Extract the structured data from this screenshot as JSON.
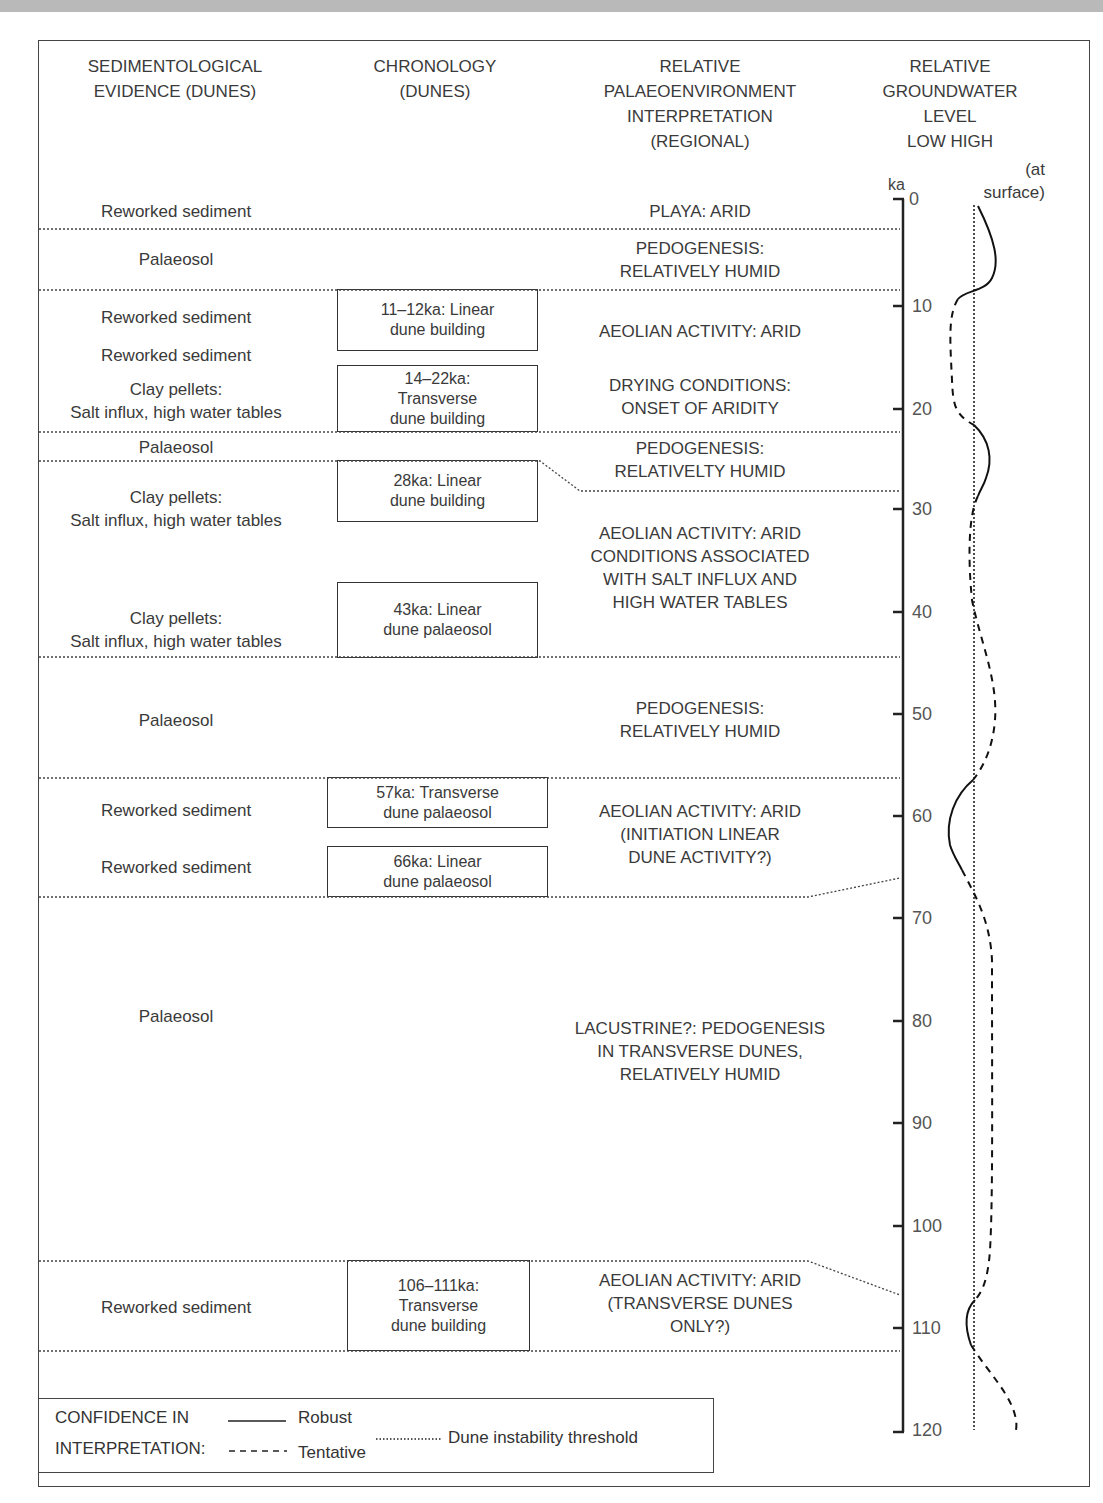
{
  "headers": {
    "sedimentology": "SEDIMENTOLOGICAL\nEVIDENCE (DUNES)",
    "chronology": "CHRONOLOGY\n(DUNES)",
    "palaeoenvironment": "RELATIVE\nPALAEOENVIRONMENT\nINTERPRETATION\n(REGIONAL)",
    "groundwater": "RELATIVE\nGROUNDWATER\nLEVEL\nLOW HIGH",
    "at_surface": "(at\nsurface)",
    "axis_unit": "ka"
  },
  "sedimentology": [
    {
      "text": "Reworked sediment",
      "y": 200
    },
    {
      "text": "Palaeosol",
      "y": 248
    },
    {
      "text": "Reworked sediment",
      "y": 306
    },
    {
      "text": "Reworked sediment",
      "y": 344
    },
    {
      "text": "Clay pellets:\nSalt influx, high water tables",
      "y": 378
    },
    {
      "text": "Palaeosol",
      "y": 436
    },
    {
      "text": "Clay pellets:\nSalt influx, high water tables",
      "y": 486
    },
    {
      "text": "Clay pellets:\nSalt influx, high water tables",
      "y": 607
    },
    {
      "text": "Palaeosol",
      "y": 709
    },
    {
      "text": "Reworked sediment",
      "y": 799
    },
    {
      "text": "Reworked sediment",
      "y": 856
    },
    {
      "text": "Palaeosol",
      "y": 1005
    },
    {
      "text": "Reworked sediment",
      "y": 1296
    }
  ],
  "chronology": [
    {
      "text": "11–12ka: Linear\ndune building",
      "x": 337,
      "y": 289,
      "w": 201,
      "h": 62
    },
    {
      "text": "14–22ka:\nTransverse\ndune building",
      "x": 337,
      "y": 365,
      "w": 201,
      "h": 67
    },
    {
      "text": "28ka: Linear\ndune building",
      "x": 337,
      "y": 460,
      "w": 201,
      "h": 62
    },
    {
      "text": "43ka: Linear\ndune palaeosol",
      "x": 337,
      "y": 582,
      "w": 201,
      "h": 76
    },
    {
      "text": "57ka: Transverse\ndune palaeosol",
      "x": 327,
      "y": 777,
      "w": 221,
      "h": 51
    },
    {
      "text": "66ka: Linear\ndune palaeosol",
      "x": 327,
      "y": 846,
      "w": 221,
      "h": 51
    },
    {
      "text": "106–111ka:\nTransverse\ndune building",
      "x": 347,
      "y": 1260,
      "w": 183,
      "h": 91
    }
  ],
  "palaeoenvironment": [
    {
      "text": "PLAYA: ARID",
      "y": 200
    },
    {
      "text": "PEDOGENESIS:\nRELATIVELY HUMID",
      "y": 237
    },
    {
      "text": "AEOLIAN ACTIVITY: ARID",
      "y": 320
    },
    {
      "text": "DRYING CONDITIONS:\nONSET OF ARIDITY",
      "y": 374
    },
    {
      "text": "PEDOGENESIS:\nRELATIVELTY HUMID",
      "y": 437
    },
    {
      "text": "AEOLIAN ACTIVITY: ARID\nCONDITIONS ASSOCIATED\nWITH SALT INFLUX AND\nHIGH WATER TABLES",
      "y": 522
    },
    {
      "text": "PEDOGENESIS:\nRELATIVELY HUMID",
      "y": 697
    },
    {
      "text": "AEOLIAN ACTIVITY: ARID\n(INITIATION LINEAR\nDUNE ACTIVITY?)",
      "y": 800
    },
    {
      "text": "LACUSTRINE?: PEDOGENESIS\nIN TRANSVERSE DUNES,\nRELATIVELY HUMID",
      "y": 1017
    },
    {
      "text": "AEOLIAN ACTIVITY: ARID\n(TRANSVERSE DUNES\nONLY?)",
      "y": 1269
    }
  ],
  "axis": {
    "ticks": [
      "0",
      "10",
      "20",
      "30",
      "40",
      "50",
      "60",
      "70",
      "80",
      "90",
      "100",
      "110",
      "120"
    ]
  },
  "legend": {
    "title_line1": "CONFIDENCE IN",
    "title_line2": "INTERPRETATION:",
    "robust": "Robust",
    "tentative": "Tentative",
    "threshold": "Dune instability threshold"
  },
  "chart_data": {
    "type": "line",
    "ylabel": "ka",
    "ylim": [
      0,
      120
    ],
    "xlabel": "Relative groundwater level (low–high)",
    "threshold_label": "Dune instability threshold",
    "segments": [
      {
        "style": "robust",
        "from_ka": 0,
        "to_ka": 9
      },
      {
        "style": "tentative",
        "from_ka": 9,
        "to_ka": 22
      },
      {
        "style": "robust",
        "from_ka": 22,
        "to_ka": 29
      },
      {
        "style": "tentative",
        "from_ka": 29,
        "to_ka": 56
      },
      {
        "style": "robust",
        "from_ka": 57,
        "to_ka": 65
      },
      {
        "style": "tentative",
        "from_ka": 65,
        "to_ka": 107
      },
      {
        "style": "robust",
        "from_ka": 107,
        "to_ka": 111
      },
      {
        "style": "tentative",
        "from_ka": 111,
        "to_ka": 120
      }
    ],
    "boundaries_ka": [
      2.5,
      8.5,
      22.5,
      25.5,
      44.5,
      56.5,
      67.5,
      103.5,
      112.5
    ]
  }
}
